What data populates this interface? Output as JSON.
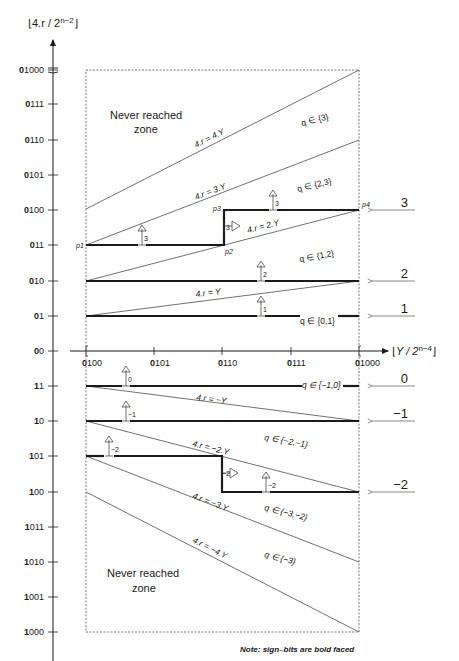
{
  "y_axis": {
    "title_main": "4.r / 2",
    "title_sup": "n−2",
    "ticks": [
      {
        "label": "01000",
        "bold": "0",
        "rest": "1000",
        "y": 70
      },
      {
        "label": "0111",
        "bold": "0",
        "rest": "111",
        "y": 104
      },
      {
        "label": "0110",
        "bold": "0",
        "rest": "110",
        "y": 140
      },
      {
        "label": "0101",
        "bold": "0",
        "rest": "101",
        "y": 175
      },
      {
        "label": "0100",
        "bold": "0",
        "rest": "100",
        "y": 210
      },
      {
        "label": "011",
        "bold": "0",
        "rest": "11",
        "y": 245
      },
      {
        "label": "010",
        "bold": "0",
        "rest": "10",
        "y": 281
      },
      {
        "label": "01",
        "bold": "0",
        "rest": "1",
        "y": 316
      },
      {
        "label": "00",
        "bold": "0",
        "rest": "0",
        "y": 351
      },
      {
        "label": "11",
        "bold": "1",
        "rest": "1",
        "y": 386
      },
      {
        "label": "10",
        "bold": "1",
        "rest": "0",
        "y": 421
      },
      {
        "label": "101",
        "bold": "1",
        "rest": "01",
        "y": 456
      },
      {
        "label": "100",
        "bold": "1",
        "rest": "00",
        "y": 492
      },
      {
        "label": "1011",
        "bold": "1",
        "rest": "011",
        "y": 527
      },
      {
        "label": "1010",
        "bold": "1",
        "rest": "010",
        "y": 562
      },
      {
        "label": "1001",
        "bold": "1",
        "rest": "001",
        "y": 597
      },
      {
        "label": "1000",
        "bold": "1",
        "rest": "000",
        "y": 632
      }
    ]
  },
  "x_axis": {
    "title_main": "Y / 2",
    "title_sup": "n−4",
    "ticks": [
      {
        "label": "0100",
        "bold": "0",
        "rest": "100",
        "x": 86
      },
      {
        "label": "0101",
        "bold": "0",
        "rest": "101",
        "x": 154
      },
      {
        "label": "0110",
        "bold": "0",
        "rest": "110",
        "x": 222
      },
      {
        "label": "0111",
        "bold": "0",
        "rest": "111",
        "x": 291
      },
      {
        "label": "01000",
        "bold": "0",
        "rest": "1000",
        "x": 359
      }
    ]
  },
  "zones": {
    "top": [
      "Never reached",
      "zone"
    ],
    "bottom": [
      "Never reached",
      "zone"
    ]
  },
  "lines": [
    {
      "label": "4.r = 4.Y"
    },
    {
      "label": "4.r = 3.Y"
    },
    {
      "label": "4.r = 2.Y"
    },
    {
      "label": "4.r = Y"
    },
    {
      "label": "4.r = −Y"
    },
    {
      "label": "4.r = −2.Y"
    },
    {
      "label": "4.r = −3.Y"
    },
    {
      "label": "4.r = −4.Y"
    }
  ],
  "q_regions": [
    {
      "label": "q ∈ {3}"
    },
    {
      "label": "q ∈ {2,3}"
    },
    {
      "label": "q ∈ {1,2}"
    },
    {
      "label": "q ∈ {0,1}"
    },
    {
      "label": "q ∈ {−1,0}"
    },
    {
      "label": "q ∈ {−2,−1}"
    },
    {
      "label": "q ∈ {−3,−2}"
    },
    {
      "label": "q ∈ {−3}"
    }
  ],
  "points": {
    "p1": "p1",
    "p2": "p2",
    "p3": "p3",
    "p4": "p4"
  },
  "digit_symbols": [
    "3",
    "3",
    "2",
    "1",
    "0",
    "−1",
    "−2",
    "−2",
    "3",
    "−2"
  ],
  "side_labels": [
    {
      "label": "3",
      "y": 210
    },
    {
      "label": "2",
      "y": 281
    },
    {
      "label": "1",
      "y": 316
    },
    {
      "label": "0",
      "y": 386
    },
    {
      "label": "−1",
      "y": 421
    },
    {
      "label": "−2",
      "y": 492
    }
  ],
  "note": "Note: sign–bits are bold faced",
  "colors": {
    "ink": "#1a1a1a",
    "thin": "#333333",
    "dash": "#555555"
  }
}
